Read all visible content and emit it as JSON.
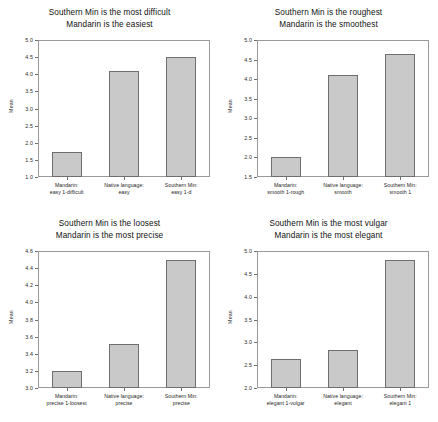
{
  "chart_data": [
    {
      "type": "bar",
      "panel": "top-left",
      "title": "Southern Min is the most difficult\nMandarin is the easiest",
      "title_lines": [
        "Southern Min is the most difficult",
        "Mandarin is the easiest"
      ],
      "xlabel": "",
      "ylabel": "Mean",
      "ylim": [
        1.0,
        5.0
      ],
      "ytick_step": 0.5,
      "yticks": [
        "1.0",
        "1.5",
        "2.0",
        "2.5",
        "3.0",
        "3.5",
        "4.0",
        "4.5",
        "5.0"
      ],
      "grid": false,
      "legend": "none",
      "categories": [
        "Mandarin:\neasy 1-difficult",
        "Native language:\neasy",
        "Southern Min:\neasy 1-d"
      ],
      "category_lines": [
        [
          "Mandarin:",
          "easy 1-difficult"
        ],
        [
          "Native language:",
          "easy"
        ],
        [
          "Southern Min:",
          "easy 1-d"
        ]
      ],
      "values": [
        1.72,
        4.1,
        4.49
      ]
    },
    {
      "type": "bar",
      "panel": "top-right",
      "title": "Southern Min is the roughest\nMandarin is the smoothest",
      "title_lines": [
        "Southern Min is the roughest",
        "Mandarin is the smoothest"
      ],
      "xlabel": "",
      "ylabel": "Mean",
      "ylim": [
        1.5,
        5.0
      ],
      "ytick_step": 0.5,
      "yticks": [
        "1.5",
        "2.0",
        "2.5",
        "3.0",
        "3.5",
        "4.0",
        "4.5",
        "5.0"
      ],
      "grid": false,
      "legend": "none",
      "categories": [
        "Mandarin:\nsmooth 1-rough",
        "Native language:\nsmooth",
        "Southern Min:\nsmooth 1"
      ],
      "category_lines": [
        [
          "Mandarin:",
          "smooth 1-rough"
        ],
        [
          "Native language:",
          "smooth"
        ],
        [
          "Southern Min:",
          "smooth 1"
        ]
      ],
      "values": [
        2.0,
        4.11,
        4.63
      ]
    },
    {
      "type": "bar",
      "panel": "bottom-left",
      "title": "Southern Min is the loosest\nMandarin is the most precise",
      "title_lines": [
        "Southern Min is the loosest",
        "Mandarin is the most precise"
      ],
      "xlabel": "",
      "ylabel": "Mean",
      "ylim": [
        3.0,
        4.6
      ],
      "ytick_step": 0.2,
      "yticks": [
        "3.0",
        "3.2",
        "3.4",
        "3.6",
        "3.8",
        "4.0",
        "4.2",
        "4.4",
        "4.6"
      ],
      "grid": false,
      "legend": "none",
      "categories": [
        "Mandarin:\nprecise 1-loosest",
        "Native language:\nprecise",
        "Southern Min:\nprecise"
      ],
      "category_lines": [
        [
          "Mandarin:",
          "precise 1-loosest"
        ],
        [
          "Native language:",
          "precise"
        ],
        [
          "Southern Min:",
          "precise"
        ]
      ],
      "values": [
        3.2,
        3.51,
        4.5
      ]
    },
    {
      "type": "bar",
      "panel": "bottom-right",
      "title": "Southern Min is the most vulgar\nMandarin is the most elegant",
      "title_lines": [
        "Southern Min is the most vulgar",
        "Mandarin is the most elegant"
      ],
      "xlabel": "",
      "ylabel": "Mean",
      "ylim": [
        2.0,
        5.0
      ],
      "ytick_step": 0.5,
      "yticks": [
        "2.0",
        "2.5",
        "3.0",
        "3.5",
        "4.0",
        "4.5",
        "5.0"
      ],
      "grid": false,
      "legend": "none",
      "categories": [
        "Mandarin:\nelegant 1-vulgar",
        "Native language:\nelegant",
        "Southern Min:\nelegant 1"
      ],
      "category_lines": [
        [
          "Mandarin:",
          "elegant 1-vulgar"
        ],
        [
          "Native language:",
          "elegant"
        ],
        [
          "Southern Min:",
          "elegant 1"
        ]
      ],
      "values": [
        2.63,
        2.84,
        4.8
      ]
    }
  ],
  "style": {
    "bar_fill": "#c9c9c9",
    "bar_border": "#6e6e6e",
    "frame_color": "#9a9a9a",
    "text_color": "#1a1a1a",
    "background": "#ffffff"
  }
}
